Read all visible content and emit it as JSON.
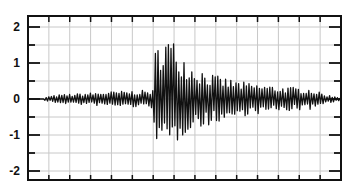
{
  "chart_data": {
    "type": "line",
    "title": "",
    "xlabel": "",
    "ylabel": "",
    "ylim": [
      -2.2,
      2.3
    ],
    "yticks": [
      2,
      1,
      0,
      -1,
      -2
    ],
    "ytick_labels": [
      "2",
      "1",
      "0",
      "-1",
      "-2"
    ],
    "x_divisions": 15,
    "grid": true,
    "legend": null,
    "series": [
      {
        "name": "waveform",
        "color": "#111111",
        "description": "seismogram-like trace: flat start, low noise ~±0.1, strong burst beginning ~40% across peaking near +1.9 / -1.5, then decaying coda to ~±0.1",
        "envelope_points": [
          {
            "x": 0.0,
            "amp": 0.0
          },
          {
            "x": 0.05,
            "amp": 0.05
          },
          {
            "x": 0.1,
            "amp": 0.12
          },
          {
            "x": 0.25,
            "amp": 0.2
          },
          {
            "x": 0.4,
            "amp": 0.25
          },
          {
            "x": 0.405,
            "amp": 1.3
          },
          {
            "x": 0.43,
            "amp": 1.9
          },
          {
            "x": 0.47,
            "amp": 1.6
          },
          {
            "x": 0.52,
            "amp": 1.0
          },
          {
            "x": 0.6,
            "amp": 0.65
          },
          {
            "x": 0.7,
            "amp": 0.45
          },
          {
            "x": 0.8,
            "amp": 0.35
          },
          {
            "x": 0.9,
            "amp": 0.3
          },
          {
            "x": 0.95,
            "amp": 0.12
          },
          {
            "x": 1.0,
            "amp": 0.05
          }
        ]
      }
    ]
  },
  "axes": {
    "y_labels": [
      "2",
      "1",
      "0",
      "-1",
      "-2"
    ],
    "colors": {
      "frame": "#111111",
      "grid": "#c8c8c8",
      "trace": "#111111"
    }
  }
}
